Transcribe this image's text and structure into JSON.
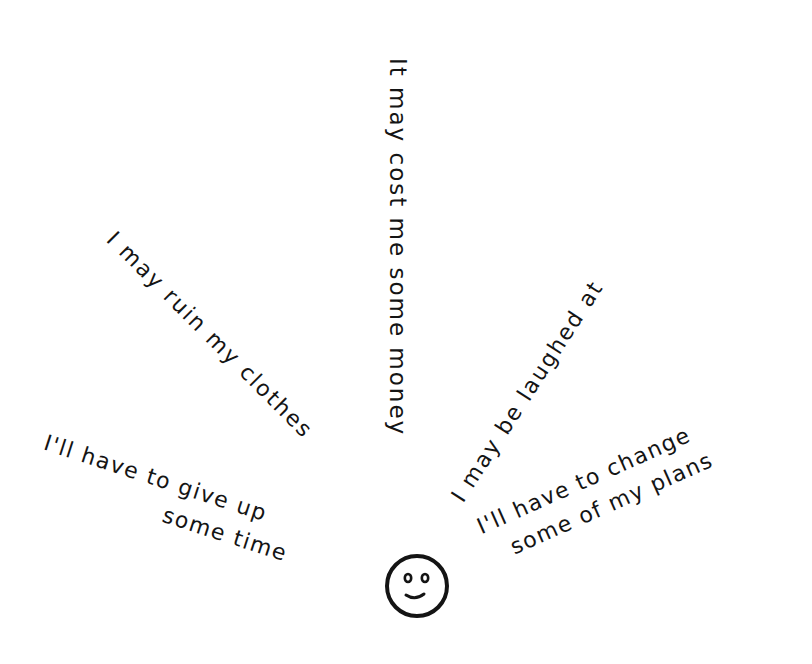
{
  "illustration": {
    "center_icon": "smiley-face-icon",
    "ink_color": "#141414",
    "background_color": "#ffffff",
    "phrases": {
      "money": "It may cost me some money",
      "clothes": "I may ruin my clothes",
      "laughed": "I may be laughed at",
      "time": {
        "line1": "I'll have to give up",
        "line2": "some time"
      },
      "plans": {
        "line1": "I'll have to change",
        "line2": "some of my plans"
      }
    }
  }
}
